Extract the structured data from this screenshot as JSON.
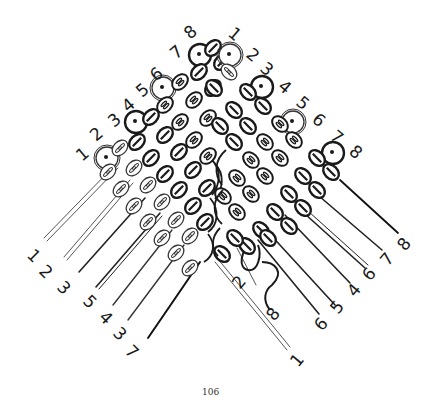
{
  "diagram": {
    "page_number": "106",
    "colors": {
      "ink": "#1a1a1a",
      "light_bead_stroke": "#444444",
      "paper": "#ffffff"
    },
    "top_labels_left_group": [
      "1",
      "2",
      "3",
      "4",
      "5",
      "6",
      "7",
      "8"
    ],
    "top_labels_right_group": [
      "1",
      "2",
      "3",
      "4",
      "5",
      "6",
      "7",
      "8"
    ],
    "bottom_labels_left_group": [
      "1",
      "2",
      "3",
      "5",
      "4",
      "3",
      "7"
    ],
    "bottom_labels_right_group": [
      "2",
      "8",
      "6",
      "5",
      "4",
      "6",
      "7",
      "8"
    ],
    "bottom_center_label": "1",
    "legend": {
      "dark_bead": "dark bead (single slash)",
      "light_bead": "light bead (double oval)",
      "start_bead": "starting bead with dot"
    }
  }
}
